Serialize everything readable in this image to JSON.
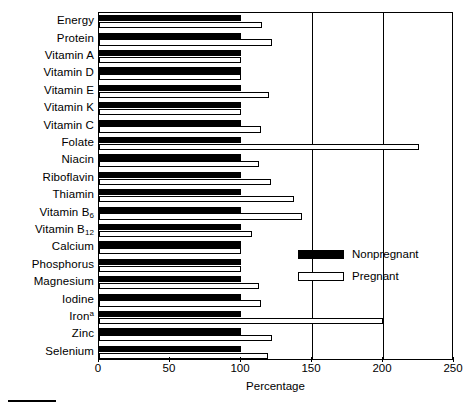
{
  "chart_data": {
    "type": "bar",
    "orientation": "horizontal",
    "title": "",
    "xlabel": "Percentage",
    "ylabel": "",
    "xlim": [
      0,
      250
    ],
    "xticks": [
      0,
      50,
      100,
      150,
      200,
      250
    ],
    "gridlines_at": [
      150,
      200
    ],
    "grid": true,
    "legend_position": "center-right",
    "categories": [
      "Energy",
      "Protein",
      "Vitamin A",
      "Vitamin D",
      "Vitamin E",
      "Vitamin K",
      "Vitamin C",
      "Folate",
      "Niacin",
      "Riboflavin",
      "Thiamin",
      "Vitamin B6",
      "Vitamin B12",
      "Calcium",
      "Phosphorus",
      "Magnesium",
      "Iodine",
      "Iron",
      "Zinc",
      "Selenium"
    ],
    "category_labels_html": [
      "Energy",
      "Protein",
      "Vitamin A",
      "Vitamin D",
      "Vitamin E",
      "Vitamin K",
      "Vitamin C",
      "Folate",
      "Niacin",
      "Riboflavin",
      "Thiamin",
      "Vitamin B<sub>6</sub>",
      "Vitamin B<sub>12</sub>",
      "Calcium",
      "Phosphorus",
      "Magnesium",
      "Iodine",
      "Iron<sup>a</sup>",
      "Zinc",
      "Selenium"
    ],
    "series": [
      {
        "name": "Nonpregnant",
        "style": "filled-black",
        "values": [
          100,
          100,
          100,
          100,
          100,
          100,
          100,
          100,
          100,
          100,
          100,
          100,
          100,
          100,
          100,
          100,
          100,
          100,
          100,
          100
        ]
      },
      {
        "name": "Pregnant",
        "style": "open-white",
        "values": [
          115,
          122,
          100,
          100,
          120,
          100,
          114,
          225,
          113,
          121,
          137,
          143,
          108,
          100,
          100,
          113,
          114,
          200,
          122,
          119
        ]
      }
    ]
  },
  "legend": {
    "entries": [
      {
        "label": "Nonpregnant",
        "swatch": "filled-black"
      },
      {
        "label": "Pregnant",
        "swatch": "open-white"
      }
    ]
  },
  "axis": {
    "x_title": "Percentage",
    "x_tick_labels": [
      "0",
      "50",
      "100",
      "150",
      "200",
      "250"
    ]
  },
  "colors": {
    "nonpregnant": "#000000",
    "pregnant": "#ffffff",
    "axis": "#000000",
    "background": "#ffffff"
  }
}
